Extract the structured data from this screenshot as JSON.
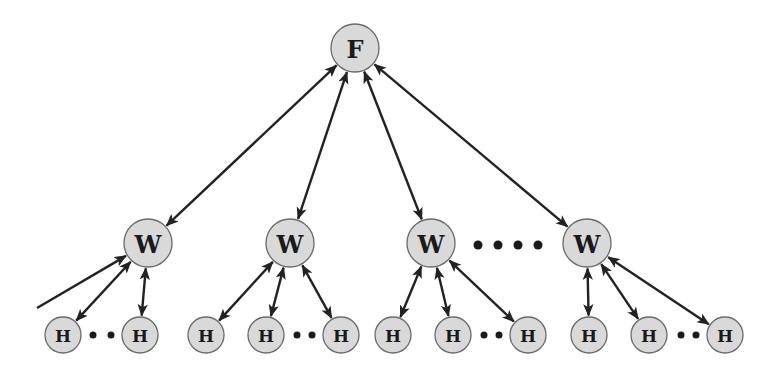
{
  "diagram": {
    "type": "hierarchical-tree",
    "colors": {
      "node_fill": "#d9d9d9",
      "node_stroke": "#6a6a6a",
      "edge": "#222222",
      "label": "#1a1a1a",
      "background": "#ffffff"
    },
    "root": {
      "id": "F",
      "label": "F",
      "x": 355,
      "y": 48,
      "r": 24
    },
    "workers": [
      {
        "id": "W1",
        "label": "W",
        "x": 148,
        "y": 243,
        "r": 24
      },
      {
        "id": "W2",
        "label": "W",
        "x": 290,
        "y": 243,
        "r": 24
      },
      {
        "id": "W3",
        "label": "W",
        "x": 431,
        "y": 243,
        "r": 24
      },
      {
        "id": "W4",
        "label": "W",
        "x": 587,
        "y": 243,
        "r": 24
      }
    ],
    "workers_ellipsis": {
      "dots": [
        478,
        498,
        518,
        538
      ],
      "y": 245,
      "r": 4.5
    },
    "helpers": [
      {
        "id": "H1-1",
        "label": "H",
        "parent": "W1",
        "x": 63,
        "y": 335,
        "r": 18
      },
      {
        "id": "H1-2",
        "label": "H",
        "parent": "W1",
        "x": 140,
        "y": 335,
        "r": 18
      },
      {
        "id": "H2-1",
        "label": "H",
        "parent": "W2",
        "x": 206,
        "y": 335,
        "r": 18
      },
      {
        "id": "H2-2",
        "label": "H",
        "parent": "W2",
        "x": 266,
        "y": 335,
        "r": 18
      },
      {
        "id": "H2-3",
        "label": "H",
        "parent": "W2",
        "x": 341,
        "y": 335,
        "r": 18
      },
      {
        "id": "H3-1",
        "label": "H",
        "parent": "W3",
        "x": 393,
        "y": 335,
        "r": 18
      },
      {
        "id": "H3-2",
        "label": "H",
        "parent": "W3",
        "x": 453,
        "y": 335,
        "r": 18
      },
      {
        "id": "H3-3",
        "label": "H",
        "parent": "W3",
        "x": 528,
        "y": 335,
        "r": 18
      },
      {
        "id": "H4-1",
        "label": "H",
        "parent": "W4",
        "x": 589,
        "y": 335,
        "r": 18
      },
      {
        "id": "H4-2",
        "label": "H",
        "parent": "W4",
        "x": 649,
        "y": 335,
        "r": 18
      },
      {
        "id": "H4-3",
        "label": "H",
        "parent": "W4",
        "x": 725,
        "y": 335,
        "r": 18
      }
    ],
    "helper_ellipses": [
      {
        "between": [
          "H1-1",
          "H1-2"
        ],
        "dots": [
          93,
          111
        ],
        "y": 335,
        "r": 3.5
      },
      {
        "between": [
          "H2-2",
          "H2-3"
        ],
        "dots": [
          297,
          312
        ],
        "y": 335,
        "r": 3.5
      },
      {
        "between": [
          "H3-2",
          "H3-3"
        ],
        "dots": [
          484,
          499
        ],
        "y": 335,
        "r": 3.5
      },
      {
        "between": [
          "H4-2",
          "H4-3"
        ],
        "dots": [
          681,
          696
        ],
        "y": 335,
        "r": 3.5
      }
    ],
    "edges": [
      {
        "from": "F",
        "to": "W1",
        "bidirectional": true
      },
      {
        "from": "F",
        "to": "W2",
        "bidirectional": true
      },
      {
        "from": "F",
        "to": "W3",
        "bidirectional": true
      },
      {
        "from": "F",
        "to": "W4",
        "bidirectional": true
      },
      {
        "from": "W1",
        "to": "H1-1",
        "bidirectional": true
      },
      {
        "from": "W1",
        "to": "H1-2",
        "bidirectional": true
      },
      {
        "from": "W2",
        "to": "H2-1",
        "bidirectional": true
      },
      {
        "from": "W2",
        "to": "H2-2",
        "bidirectional": true
      },
      {
        "from": "W2",
        "to": "H2-3",
        "bidirectional": true
      },
      {
        "from": "W3",
        "to": "H3-1",
        "bidirectional": true
      },
      {
        "from": "W3",
        "to": "H3-2",
        "bidirectional": true
      },
      {
        "from": "W3",
        "to": "H3-3",
        "bidirectional": true
      },
      {
        "from": "W4",
        "to": "H4-1",
        "bidirectional": true
      },
      {
        "from": "W4",
        "to": "H4-2",
        "bidirectional": true
      },
      {
        "from": "W4",
        "to": "H4-3",
        "bidirectional": true
      }
    ],
    "external_edges": [
      {
        "from_point": [
          37,
          308
        ],
        "to": "W1",
        "bidirectional": false
      }
    ]
  }
}
